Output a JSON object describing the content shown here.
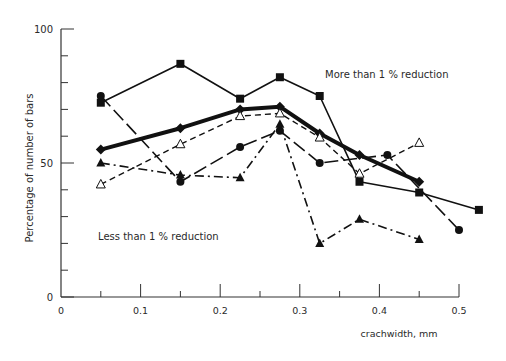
{
  "chart_data": {
    "type": "line",
    "title": "",
    "xlabel": "crachwidth, mm",
    "ylabel": "Percentage of number of bars",
    "xlim": [
      0,
      0.55
    ],
    "ylim": [
      0,
      100
    ],
    "x_ticks": [
      "0",
      "0.1",
      "0.2",
      "0.3",
      "0.4",
      "0.5"
    ],
    "y_ticks": [
      "0",
      "50",
      "100"
    ],
    "grid": false,
    "annotations": [
      {
        "text": "More than 1 % reduction",
        "x": 0.33,
        "y": 86
      },
      {
        "text": "Less than 1 % reduction",
        "x": 0.05,
        "y": 22
      }
    ],
    "series": [
      {
        "name": "squares",
        "marker": "square-filled",
        "line": "solid-thin",
        "x": [
          0.05,
          0.15,
          0.225,
          0.275,
          0.325,
          0.375,
          0.45,
          0.525
        ],
        "values": [
          72.5,
          87,
          74,
          82,
          75,
          43,
          39,
          32.5
        ]
      },
      {
        "name": "diamonds",
        "marker": "diamond-filled",
        "line": "solid-thick",
        "x": [
          0.05,
          0.15,
          0.225,
          0.275,
          0.325,
          0.375,
          0.45
        ],
        "values": [
          55,
          63,
          70,
          71,
          61,
          53,
          43
        ]
      },
      {
        "name": "circles",
        "marker": "circle-filled",
        "line": "long-dash",
        "x": [
          0.05,
          0.15,
          0.225,
          0.275,
          0.325,
          0.41,
          0.5
        ],
        "values": [
          75,
          43,
          56,
          62,
          50,
          53,
          25
        ]
      },
      {
        "name": "filled-triangles",
        "marker": "triangle-filled",
        "line": "dash-dot",
        "x": [
          0.05,
          0.15,
          0.225,
          0.275,
          0.325,
          0.375,
          0.45
        ],
        "values": [
          50,
          45.5,
          44.5,
          64.5,
          20,
          29,
          21.5
        ]
      },
      {
        "name": "open-triangles",
        "marker": "triangle-open",
        "line": "dashed",
        "x": [
          0.05,
          0.15,
          0.225,
          0.275,
          0.325,
          0.375,
          0.45
        ],
        "values": [
          42,
          57,
          67.5,
          68.5,
          59.5,
          46,
          57.5
        ]
      }
    ]
  }
}
